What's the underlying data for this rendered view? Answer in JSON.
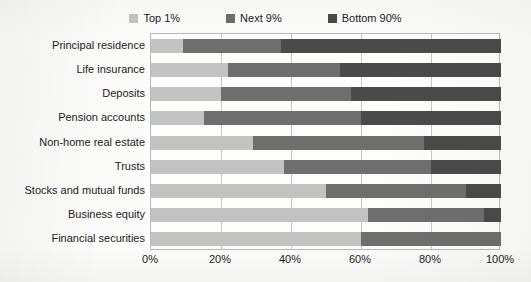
{
  "chart_data": {
    "type": "bar",
    "orientation": "horizontal",
    "stacked": true,
    "title": "",
    "xlabel": "",
    "ylabel": "",
    "xlim": [
      0,
      100
    ],
    "grid": true,
    "legend_position": "top-center",
    "xtick_labels": [
      "0%",
      "20%",
      "40%",
      "60%",
      "80%",
      "100%"
    ],
    "xtick_values": [
      0,
      20,
      40,
      60,
      80,
      100
    ],
    "categories": [
      "Principal residence",
      "Life insurance",
      "Deposits",
      "Pension accounts",
      "Non-home real estate",
      "Trusts",
      "Stocks and mutual funds",
      "Business equity",
      "Financial securities"
    ],
    "series": [
      {
        "name": "Top 1%",
        "color": "#c3c3c3",
        "values": [
          9,
          22,
          20,
          15,
          29,
          38,
          50,
          62,
          60
        ]
      },
      {
        "name": "Next 9%",
        "color": "#6e6e6e",
        "values": [
          28,
          32,
          37,
          45,
          49,
          42,
          40,
          33,
          40
        ]
      },
      {
        "name": "Bottom 90%",
        "color": "#4a4a4a",
        "values": [
          63,
          46,
          43,
          40,
          22,
          20,
          10,
          5,
          0
        ]
      }
    ]
  },
  "legend": {
    "items": [
      {
        "label": "Top 1%",
        "color": "#c3c3c3"
      },
      {
        "label": "Next 9%",
        "color": "#6e6e6e"
      },
      {
        "label": "Bottom 90%",
        "color": "#4a4a4a"
      }
    ]
  }
}
